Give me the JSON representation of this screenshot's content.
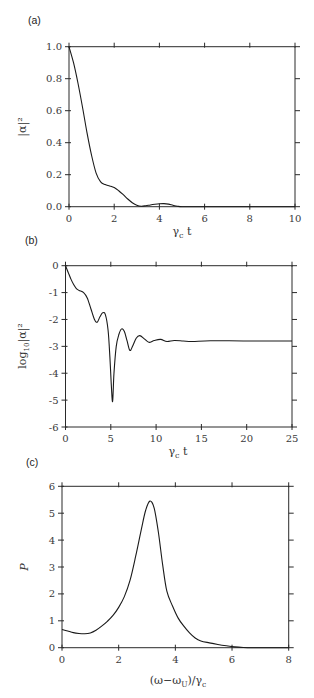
{
  "chart_data": [
    {
      "id": "a",
      "type": "line",
      "panel_label": "(a)",
      "title": "",
      "xlabel": "γc t",
      "ylabel": "|α|²",
      "xlim": [
        0,
        10
      ],
      "ylim": [
        0,
        1.0
      ],
      "xticks": [
        0,
        2,
        4,
        6,
        8,
        10
      ],
      "xtick_labels": [
        "0",
        "2",
        "4",
        "6",
        "8",
        "10"
      ],
      "yticks": [
        0,
        0.2,
        0.4,
        0.6,
        0.8,
        1.0
      ],
      "ytick_labels": [
        "0.0",
        "0.2",
        "0.4",
        "0.6",
        "0.8",
        "1.0"
      ],
      "grid": false,
      "legend": null,
      "series": [
        {
          "name": "|α|²",
          "x": [
            0,
            0.2,
            0.4,
            0.6,
            0.8,
            1.0,
            1.2,
            1.4,
            1.6,
            1.8,
            2.0,
            2.2,
            2.4,
            2.6,
            2.8,
            3.0,
            3.2,
            3.4,
            3.6,
            3.8,
            4.0,
            4.2,
            4.4,
            4.6,
            4.8,
            5.0,
            5.5,
            6,
            7,
            8,
            9,
            10
          ],
          "y": [
            1.0,
            0.9,
            0.77,
            0.62,
            0.46,
            0.32,
            0.21,
            0.155,
            0.138,
            0.13,
            0.12,
            0.1,
            0.075,
            0.048,
            0.025,
            0.009,
            0.003,
            0.006,
            0.011,
            0.015,
            0.018,
            0.019,
            0.016,
            0.009,
            0.003,
            0.0,
            0.0,
            0.0,
            0.0,
            0.0,
            0.0,
            0.0
          ]
        }
      ]
    },
    {
      "id": "b",
      "type": "line",
      "panel_label": "(b)",
      "title": "",
      "xlabel": "γc t",
      "ylabel": "log10|α|²",
      "xlim": [
        0,
        25
      ],
      "ylim": [
        -6,
        0
      ],
      "xticks": [
        0,
        5,
        10,
        15,
        20,
        25
      ],
      "xtick_labels": [
        "0",
        "5",
        "10",
        "15",
        "20",
        "25"
      ],
      "yticks": [
        -6,
        -5,
        -4,
        -3,
        -2,
        -1,
        0
      ],
      "ytick_labels": [
        "-6",
        "-5",
        "-4",
        "-3",
        "-2",
        "-1",
        "0"
      ],
      "grid": false,
      "legend": null,
      "series": [
        {
          "name": "log10|α|²",
          "x": [
            0,
            0.3,
            0.6,
            0.9,
            1.2,
            1.5,
            2.0,
            2.4,
            2.8,
            3.2,
            3.5,
            3.8,
            4.1,
            4.4,
            4.7,
            4.9,
            5.05,
            5.2,
            5.35,
            5.6,
            5.9,
            6.2,
            6.5,
            6.8,
            7.1,
            7.4,
            7.8,
            8.2,
            8.7,
            9.2,
            9.8,
            10.5,
            11.2,
            12.0,
            13.0,
            14.0,
            16.0,
            20.0,
            25.0
          ],
          "y": [
            0,
            -0.25,
            -0.5,
            -0.7,
            -0.85,
            -0.92,
            -1.0,
            -1.2,
            -1.6,
            -2.0,
            -2.1,
            -1.9,
            -1.75,
            -1.82,
            -2.4,
            -3.4,
            -4.4,
            -5.05,
            -4.0,
            -3.0,
            -2.55,
            -2.35,
            -2.45,
            -2.8,
            -3.15,
            -3.0,
            -2.7,
            -2.6,
            -2.72,
            -2.85,
            -2.78,
            -2.74,
            -2.82,
            -2.78,
            -2.8,
            -2.82,
            -2.79,
            -2.8,
            -2.8
          ]
        }
      ]
    },
    {
      "id": "c",
      "type": "line",
      "panel_label": "(c)",
      "title": "",
      "xlabel": "(ω−ωU)/γc",
      "ylabel": "P",
      "xlim": [
        0,
        8
      ],
      "ylim": [
        0,
        6
      ],
      "xticks": [
        0,
        2,
        4,
        6,
        8
      ],
      "xtick_labels": [
        "0",
        "2",
        "4",
        "6",
        "8"
      ],
      "yticks": [
        0,
        1,
        2,
        3,
        4,
        5,
        6
      ],
      "ytick_labels": [
        "0",
        "1",
        "2",
        "3",
        "4",
        "5",
        "6"
      ],
      "grid": false,
      "legend": null,
      "series": [
        {
          "name": "P",
          "x": [
            0,
            0.2,
            0.4,
            0.6,
            0.8,
            1.0,
            1.2,
            1.4,
            1.6,
            1.8,
            2.0,
            2.2,
            2.4,
            2.6,
            2.8,
            2.95,
            3.1,
            3.25,
            3.4,
            3.55,
            3.7,
            3.9,
            4.1,
            4.3,
            4.5,
            4.7,
            4.9,
            5.2,
            5.5,
            5.8,
            6.1,
            6.4,
            6.7,
            7.0,
            8.0
          ],
          "y": [
            0.68,
            0.62,
            0.56,
            0.53,
            0.52,
            0.55,
            0.65,
            0.8,
            0.98,
            1.2,
            1.5,
            1.9,
            2.5,
            3.4,
            4.4,
            5.1,
            5.45,
            5.2,
            4.3,
            3.1,
            2.1,
            1.55,
            1.1,
            0.8,
            0.55,
            0.36,
            0.25,
            0.18,
            0.12,
            0.07,
            0.03,
            0.01,
            0.0,
            0.0,
            0.0
          ]
        }
      ]
    }
  ],
  "panels": {
    "a": {
      "label": "(a)",
      "xlabel_main": "γ",
      "xlabel_sub": "c",
      "xlabel_tail": " t",
      "ylabel": "|α|²"
    },
    "b": {
      "label": "(b)",
      "xlabel_main": "γ",
      "xlabel_sub": "c",
      "xlabel_tail": " t",
      "ylabel_main": "log",
      "ylabel_sub": "10",
      "ylabel_tail": "|α|²"
    },
    "c": {
      "label": "(c)",
      "xlabel_pre": "(ω−ω",
      "xlabel_sub1": "U",
      "xlabel_mid": ")/γ",
      "xlabel_sub2": "c",
      "ylabel": "P"
    }
  }
}
